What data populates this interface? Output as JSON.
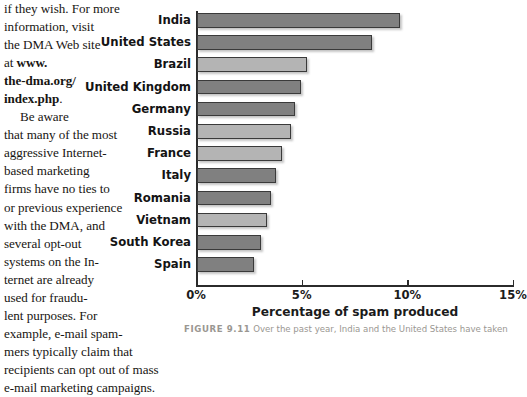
{
  "body_text": {
    "cut_top_line": "e-mail marketing campaigns",
    "paragraph_1_lines": [
      "if they wish. For more",
      "information, visit",
      "the DMA Web site",
      "at "
    ],
    "url_lines": [
      "www.",
      "the-dma.org/",
      "index.php"
    ],
    "url_trailing": ".",
    "paragraph_2_lines": [
      "Be aware",
      "that many of the most",
      "aggressive Internet-",
      "based marketing",
      "firms have no ties to",
      "or previous experience",
      "with the DMA, and",
      "several opt-out",
      "systems on the In-",
      "ternet are already",
      "used for fraudu-",
      "lent purposes. For",
      "example, e-mail spam-",
      "mers typically claim that",
      "recipients can opt out of mass",
      "e-mail marketing campaigns."
    ]
  },
  "figure": {
    "caption_number": "FIGURE 9.11",
    "caption_text": "Over the past year, India and the United States have taken"
  },
  "chart_data": {
    "type": "bar",
    "orientation": "horizontal",
    "title": "",
    "xlabel": "Percentage of spam produced",
    "ylabel": "",
    "xlim": [
      0,
      15
    ],
    "xticks": [
      0,
      5,
      10,
      15
    ],
    "xtick_labels": [
      "0%",
      "5%",
      "10%",
      "15%"
    ],
    "grid": false,
    "legend": "none",
    "categories": [
      "India",
      "United States",
      "Brazil",
      "United Kingdom",
      "Germany",
      "Russia",
      "France",
      "Italy",
      "Romania",
      "Vietnam",
      "South Korea",
      "Spain"
    ],
    "values": [
      9.6,
      8.3,
      5.2,
      4.9,
      4.65,
      4.45,
      4.0,
      3.75,
      3.5,
      3.3,
      3.05,
      2.7
    ],
    "bar_colors": [
      "#808080",
      "#808080",
      "#b4b4b4",
      "#808080",
      "#808080",
      "#b4b4b4",
      "#b4b4b4",
      "#808080",
      "#808080",
      "#b4b4b4",
      "#808080",
      "#808080"
    ],
    "bar_border_color": "#3a3a3a",
    "axis_color": "#2b2b2b"
  }
}
